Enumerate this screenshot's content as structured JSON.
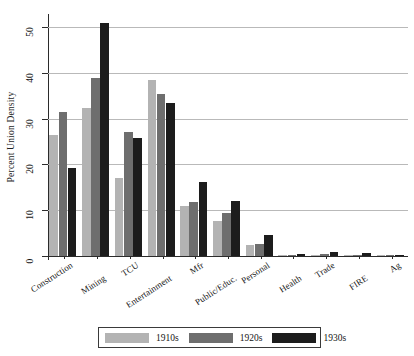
{
  "chart_data": {
    "type": "bar",
    "title": "",
    "subtitle": "",
    "xlabel": "",
    "ylabel": "Percent Union Density",
    "ylim": [
      0,
      52
    ],
    "yticks": [
      0,
      10,
      20,
      30,
      40,
      50
    ],
    "ytick_labels": [
      "0",
      "10",
      "20",
      "30",
      "40",
      "50"
    ],
    "grid": "horizontal",
    "legend_position": "bottom-center",
    "categories": [
      "Construction",
      "Mining",
      "TCU",
      "Entertainment",
      "Mfr",
      "Public/Educ.",
      "Personal",
      "Health",
      "Trade",
      "FIRE",
      "Ag"
    ],
    "series": [
      {
        "name": "1910s",
        "color": "#b3b3b3",
        "values": [
          26.4,
          32.3,
          17.0,
          38.5,
          11.0,
          7.7,
          2.3,
          0.2,
          0.3,
          0.2,
          0.1
        ]
      },
      {
        "name": "1920s",
        "color": "#6e6e6e",
        "values": [
          31.5,
          39.0,
          27.2,
          35.5,
          11.7,
          9.5,
          2.6,
          0.3,
          0.5,
          0.3,
          0.1
        ]
      },
      {
        "name": "1930s",
        "color": "#1c1c1c",
        "values": [
          19.3,
          51.0,
          25.8,
          33.4,
          16.1,
          12.1,
          4.5,
          0.5,
          0.9,
          0.6,
          0.2
        ]
      }
    ]
  },
  "legend": {
    "items": [
      {
        "label": "1910s",
        "color": "#b3b3b3"
      },
      {
        "label": "1920s",
        "color": "#6e6e6e"
      },
      {
        "label": "1930s",
        "color": "#1c1c1c"
      }
    ]
  },
  "axes": {
    "y_axis_title": "Percent Union Density"
  },
  "colors": {
    "background": "#ffffff",
    "axis": "#2b2b2b",
    "gridline": "#b9b9b9",
    "text": "#141414"
  }
}
